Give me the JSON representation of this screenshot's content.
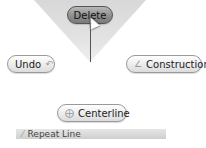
{
  "marking_menu": {
    "top": {
      "label": "Delete",
      "state": "highlighted"
    },
    "left": {
      "label": "Undo",
      "icon": "undo-arrow-icon"
    },
    "right": {
      "label": "Construction",
      "icon": "construction-line-icon"
    },
    "bottom": {
      "label": "Centerline",
      "icon": "centerline-icon"
    }
  },
  "repeat_bar": {
    "label": "Repeat Line",
    "icon": "line-icon"
  },
  "colors": {
    "wedge": "#dcdcdc",
    "active_button": "#8e8e8e",
    "button": "#ececec"
  }
}
